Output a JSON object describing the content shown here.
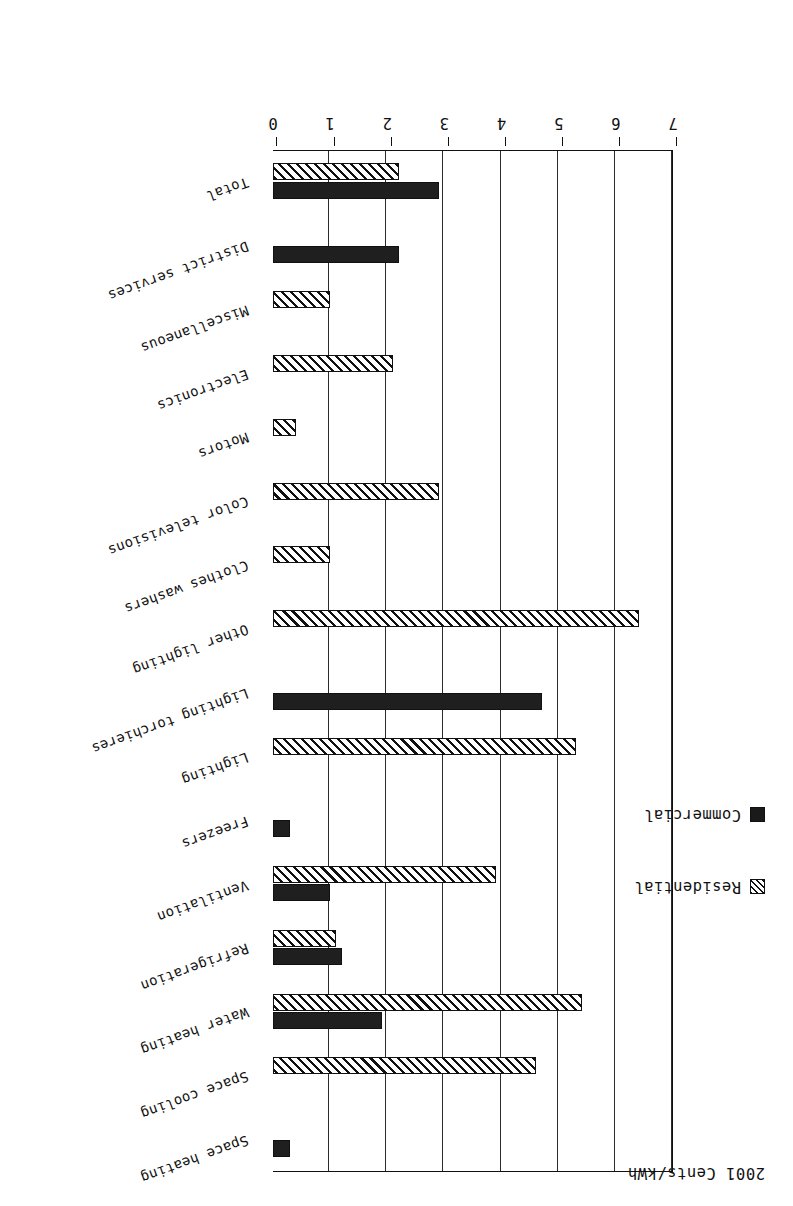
{
  "figure": {
    "title": "2001 Cents/kWh",
    "orientation": "horizontal-bars",
    "page_rotation_degrees": 180
  },
  "legend": {
    "position": "top-left",
    "entries": [
      {
        "label": "Residential",
        "swatch": "hatched-square-icon",
        "color": "#ffffff",
        "pattern": "diagonal-hatch"
      },
      {
        "label": "Commercial",
        "swatch": "filled-square-icon",
        "color": "#1f1f1f",
        "pattern": "solid"
      }
    ]
  },
  "axis": {
    "ticks": [
      "7",
      "6",
      "5",
      "4",
      "3",
      "2",
      "1",
      "0"
    ],
    "tick_values": [
      7,
      6,
      5,
      4,
      3,
      2,
      1,
      0
    ],
    "min": 0,
    "max": 7,
    "label": "2001 Cents/kWh",
    "grid": true
  },
  "chart_data": {
    "type": "bar",
    "title": "2001 Cents/kWh",
    "xlabel": "",
    "ylabel": "2001 Cents/kWh",
    "ylim": [
      0,
      7
    ],
    "grid": true,
    "legend_position": "top-left",
    "orientation": "horizontal",
    "categories": [
      "Space heating",
      "Space cooling",
      "Water heating",
      "Refrigeration",
      "Ventilation",
      "Freezers",
      "Lighting",
      "Lighting torchieres",
      "Other lighting",
      "Clothes washers",
      "Color televisions",
      "Motors",
      "Electronics",
      "Miscellaneous",
      "District services",
      "Total"
    ],
    "series": [
      {
        "name": "Residential",
        "pattern": "diagonal-hatch",
        "color": "#ffffff",
        "values": [
          0.0,
          4.6,
          5.4,
          1.1,
          3.9,
          0.0,
          5.3,
          0.0,
          6.4,
          1.0,
          2.9,
          0.4,
          2.1,
          1.0,
          0.0,
          2.2
        ]
      },
      {
        "name": "Commercial",
        "pattern": "solid",
        "color": "#1f1f1f",
        "values": [
          0.3,
          0.0,
          1.9,
          1.2,
          1.0,
          0.3,
          0.0,
          4.7,
          0.0,
          0.0,
          0.0,
          0.0,
          0.0,
          0.0,
          2.2,
          2.9
        ]
      }
    ]
  }
}
